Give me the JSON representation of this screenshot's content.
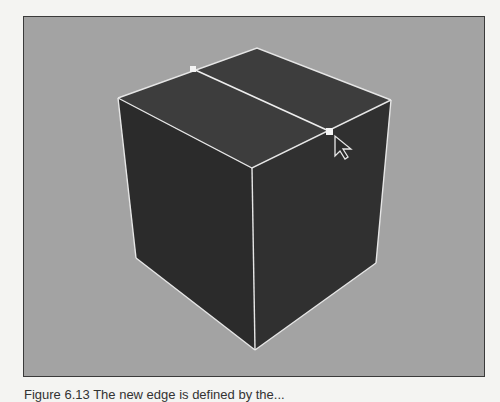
{
  "viewport": {
    "background_color": "#a3a3a3",
    "object": "cube",
    "faces": {
      "top_color": "#3d3d3d",
      "left_color": "#2b2b2b",
      "right_color": "#303030"
    },
    "edge_color": "#e6e6e6",
    "vertices": {
      "top_back": [
        256,
        47
      ],
      "top_left": [
        117,
        97
      ],
      "top_right": [
        390,
        99
      ],
      "top_front": [
        251,
        167
      ],
      "bottom_left": [
        135,
        257
      ],
      "bottom_right": [
        375,
        262
      ],
      "bottom_front": [
        254,
        349
      ]
    },
    "split_edge": {
      "start": [
        192,
        68
      ],
      "end": [
        328,
        130
      ]
    },
    "selected_vertex": [
      328,
      130
    ],
    "cursor": {
      "icon": "arrow-cursor-icon",
      "position": [
        333,
        135
      ]
    }
  },
  "caption": {
    "text": "Figure 6.13  The new edge is defined by the..."
  }
}
